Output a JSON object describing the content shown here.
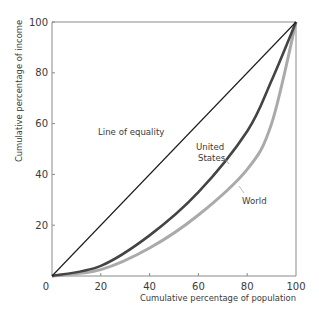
{
  "chart_data": {
    "type": "line",
    "title": "",
    "xlabel": "Cumulative percentage of population",
    "ylabel": "Cumulative percentage of income",
    "xlim": [
      0,
      100
    ],
    "ylim": [
      0,
      100
    ],
    "xticks": [
      0,
      20,
      40,
      60,
      80,
      100
    ],
    "yticks": [
      20,
      40,
      60,
      80,
      100
    ],
    "x_tick_labels": [
      "0",
      "20",
      "40",
      "60",
      "80",
      "100"
    ],
    "y_tick_labels": [
      "20",
      "40",
      "60",
      "80",
      "100"
    ],
    "grid": false,
    "legend": "none (inline annotations)",
    "series": [
      {
        "name": "Line of equality",
        "color": "#1a1a1a",
        "x": [
          0,
          20,
          40,
          60,
          80,
          100
        ],
        "values": [
          0,
          20,
          40,
          60,
          80,
          100
        ]
      },
      {
        "name": "United States",
        "color": "#444444",
        "x": [
          0,
          20,
          40,
          60,
          80,
          90,
          100
        ],
        "values": [
          0,
          4,
          16,
          33,
          57,
          77,
          100
        ]
      },
      {
        "name": "World",
        "color": "#aaaaaa",
        "x": [
          0,
          20,
          40,
          60,
          80,
          90,
          100
        ],
        "values": [
          0,
          2.5,
          11,
          24,
          42,
          60,
          100
        ]
      }
    ],
    "annotations": [
      {
        "text": "Line of equality",
        "target": "Line of equality"
      },
      {
        "text": "United States",
        "target": "United States"
      },
      {
        "text": "World",
        "target": "World"
      }
    ]
  },
  "labels": {
    "equality": "Line of equality",
    "us_line1": "United",
    "us_line2": "States",
    "world": "World"
  }
}
